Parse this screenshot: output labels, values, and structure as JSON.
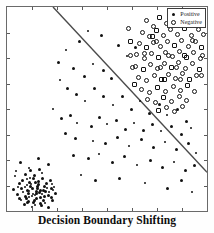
{
  "caption": "Decision Boundary Shifting",
  "legend": {
    "position": "top-right",
    "entries": [
      {
        "label": "Positive",
        "marker": "filled-dot",
        "color": "#111111"
      },
      {
        "label": "Negative",
        "marker": "open-circle",
        "color": "#111111"
      }
    ]
  },
  "chart_data": {
    "type": "scatter",
    "title": "Decision Boundary Shifting",
    "xlabel": "",
    "ylabel": "",
    "xlim": [
      0,
      1
    ],
    "ylim": [
      0,
      1
    ],
    "grid": false,
    "axis_ticks": {
      "x_count": 8,
      "y_count": 8,
      "labels_shown": false
    },
    "frame": true,
    "annotations": [
      {
        "name": "decision-boundary",
        "type": "line",
        "from": [
          0.23,
          1.0
        ],
        "to": [
          1.0,
          0.19
        ],
        "color": "#4a4a4a",
        "width": 1.4
      }
    ],
    "series": [
      {
        "name": "Positive",
        "marker": "filled-dot",
        "color": "#111111",
        "points": [
          [
            0.065,
            0.238
          ],
          [
            0.11,
            0.21
          ],
          [
            0.155,
            0.255
          ],
          [
            0.205,
            0.228
          ],
          [
            0.04,
            0.17
          ],
          [
            0.09,
            0.18
          ],
          [
            0.13,
            0.16
          ],
          [
            0.175,
            0.185
          ],
          [
            0.215,
            0.15
          ],
          [
            0.06,
            0.135
          ],
          [
            0.1,
            0.128
          ],
          [
            0.14,
            0.14
          ],
          [
            0.185,
            0.12
          ],
          [
            0.225,
            0.132
          ],
          [
            0.03,
            0.105
          ],
          [
            0.072,
            0.112
          ],
          [
            0.112,
            0.1
          ],
          [
            0.15,
            0.108
          ],
          [
            0.192,
            0.095
          ],
          [
            0.232,
            0.102
          ],
          [
            0.05,
            0.08
          ],
          [
            0.09,
            0.072
          ],
          [
            0.128,
            0.085
          ],
          [
            0.168,
            0.065
          ],
          [
            0.208,
            0.078
          ],
          [
            0.068,
            0.055
          ],
          [
            0.108,
            0.048
          ],
          [
            0.148,
            0.06
          ],
          [
            0.188,
            0.04
          ],
          [
            0.228,
            0.052
          ],
          [
            0.085,
            0.03
          ],
          [
            0.125,
            0.022
          ],
          [
            0.165,
            0.035
          ],
          [
            0.205,
            0.018
          ],
          [
            0.045,
            0.195
          ],
          [
            0.118,
            0.198
          ],
          [
            0.16,
            0.205
          ],
          [
            0.098,
            0.155
          ],
          [
            0.138,
            0.172
          ],
          [
            0.178,
            0.158
          ],
          [
            0.078,
            0.092
          ],
          [
            0.118,
            0.118
          ],
          [
            0.158,
            0.128
          ],
          [
            0.198,
            0.112
          ],
          [
            0.105,
            0.088
          ],
          [
            0.145,
            0.095
          ],
          [
            0.125,
            0.075
          ],
          [
            0.095,
            0.062
          ],
          [
            0.135,
            0.05
          ],
          [
            0.175,
            0.082
          ],
          [
            0.112,
            0.142
          ],
          [
            0.152,
            0.118
          ],
          [
            0.088,
            0.12
          ],
          [
            0.128,
            0.11
          ],
          [
            0.168,
            0.1
          ],
          [
            0.108,
            0.068
          ],
          [
            0.148,
            0.088
          ],
          [
            0.188,
            0.07
          ],
          [
            0.12,
            0.132
          ],
          [
            0.16,
            0.09
          ],
          [
            0.1,
            0.1
          ],
          [
            0.14,
            0.078
          ],
          [
            0.18,
            0.05
          ],
          [
            0.22,
            0.065
          ],
          [
            0.055,
            0.118
          ],
          [
            0.13,
            0.04
          ],
          [
            0.17,
            0.028
          ],
          [
            0.21,
            0.095
          ],
          [
            0.24,
            0.085
          ],
          [
            0.075,
            0.148
          ],
          [
            0.115,
            0.162
          ],
          [
            0.155,
            0.145
          ],
          [
            0.195,
            0.135
          ],
          [
            0.235,
            0.118
          ],
          [
            0.062,
            0.062
          ],
          [
            0.102,
            0.04
          ],
          [
            0.142,
            0.03
          ],
          [
            0.182,
            0.102
          ],
          [
            0.222,
            0.112
          ],
          [
            0.295,
            0.79
          ],
          [
            0.33,
            0.7
          ],
          [
            0.36,
            0.83
          ],
          [
            0.405,
            0.88
          ],
          [
            0.47,
            0.86
          ],
          [
            0.555,
            0.81
          ],
          [
            0.6,
            0.76
          ],
          [
            0.64,
            0.8
          ],
          [
            0.255,
            0.73
          ],
          [
            0.265,
            0.64
          ],
          [
            0.3,
            0.6
          ],
          [
            0.345,
            0.57
          ],
          [
            0.39,
            0.54
          ],
          [
            0.435,
            0.6
          ],
          [
            0.48,
            0.56
          ],
          [
            0.53,
            0.52
          ],
          [
            0.575,
            0.56
          ],
          [
            0.62,
            0.5
          ],
          [
            0.665,
            0.54
          ],
          [
            0.71,
            0.48
          ],
          [
            0.76,
            0.52
          ],
          [
            0.8,
            0.47
          ],
          [
            0.85,
            0.5
          ],
          [
            0.895,
            0.44
          ],
          [
            0.23,
            0.5
          ],
          [
            0.27,
            0.455
          ],
          [
            0.315,
            0.47
          ],
          [
            0.35,
            0.43
          ],
          [
            0.42,
            0.415
          ],
          [
            0.46,
            0.46
          ],
          [
            0.5,
            0.425
          ],
          [
            0.545,
            0.445
          ],
          [
            0.59,
            0.4
          ],
          [
            0.635,
            0.43
          ],
          [
            0.68,
            0.395
          ],
          [
            0.725,
            0.425
          ],
          [
            0.77,
            0.39
          ],
          [
            0.82,
            0.415
          ],
          [
            0.87,
            0.375
          ],
          [
            0.92,
            0.405
          ],
          [
            0.29,
            0.38
          ],
          [
            0.34,
            0.355
          ],
          [
            0.43,
            0.345
          ],
          [
            0.49,
            0.33
          ],
          [
            0.55,
            0.36
          ],
          [
            0.61,
            0.32
          ],
          [
            0.67,
            0.35
          ],
          [
            0.73,
            0.31
          ],
          [
            0.79,
            0.34
          ],
          [
            0.845,
            0.3
          ],
          [
            0.905,
            0.33
          ],
          [
            0.945,
            0.285
          ],
          [
            0.33,
            0.27
          ],
          [
            0.405,
            0.255
          ],
          [
            0.46,
            0.28
          ],
          [
            0.525,
            0.24
          ],
          [
            0.585,
            0.265
          ],
          [
            0.65,
            0.225
          ],
          [
            0.715,
            0.25
          ],
          [
            0.775,
            0.215
          ],
          [
            0.835,
            0.24
          ],
          [
            0.89,
            0.2
          ],
          [
            0.935,
            0.225
          ],
          [
            0.37,
            0.175
          ],
          [
            0.44,
            0.15
          ],
          [
            0.56,
            0.16
          ],
          [
            0.69,
            0.135
          ],
          [
            0.8,
            0.11
          ],
          [
            0.87,
            0.15
          ],
          [
            0.925,
            0.095
          ],
          [
            0.48,
            0.69
          ],
          [
            0.52,
            0.65
          ],
          [
            0.43,
            0.72
          ],
          [
            0.385,
            0.66
          ]
        ]
      },
      {
        "name": "Negative",
        "marker": "open-circle",
        "color": "#141414",
        "points": [
          [
            0.7,
            0.93
          ],
          [
            0.735,
            0.9
          ],
          [
            0.765,
            0.945
          ],
          [
            0.8,
            0.915
          ],
          [
            0.835,
            0.95
          ],
          [
            0.87,
            0.92
          ],
          [
            0.905,
            0.945
          ],
          [
            0.94,
            0.91
          ],
          [
            0.68,
            0.875
          ],
          [
            0.715,
            0.855
          ],
          [
            0.75,
            0.88
          ],
          [
            0.785,
            0.86
          ],
          [
            0.82,
            0.885
          ],
          [
            0.855,
            0.865
          ],
          [
            0.89,
            0.89
          ],
          [
            0.925,
            0.86
          ],
          [
            0.96,
            0.885
          ],
          [
            0.665,
            0.82
          ],
          [
            0.7,
            0.8
          ],
          [
            0.735,
            0.825
          ],
          [
            0.77,
            0.805
          ],
          [
            0.805,
            0.83
          ],
          [
            0.84,
            0.81
          ],
          [
            0.875,
            0.835
          ],
          [
            0.91,
            0.805
          ],
          [
            0.945,
            0.83
          ],
          [
            0.975,
            0.8
          ],
          [
            0.65,
            0.765
          ],
          [
            0.69,
            0.745
          ],
          [
            0.725,
            0.77
          ],
          [
            0.76,
            0.75
          ],
          [
            0.795,
            0.775
          ],
          [
            0.83,
            0.755
          ],
          [
            0.865,
            0.78
          ],
          [
            0.9,
            0.75
          ],
          [
            0.935,
            0.775
          ],
          [
            0.97,
            0.745
          ],
          [
            0.645,
            0.705
          ],
          [
            0.685,
            0.69
          ],
          [
            0.72,
            0.715
          ],
          [
            0.755,
            0.695
          ],
          [
            0.79,
            0.72
          ],
          [
            0.825,
            0.7
          ],
          [
            0.86,
            0.725
          ],
          [
            0.895,
            0.695
          ],
          [
            0.93,
            0.72
          ],
          [
            0.965,
            0.69
          ],
          [
            0.66,
            0.65
          ],
          [
            0.7,
            0.635
          ],
          [
            0.74,
            0.66
          ],
          [
            0.775,
            0.64
          ],
          [
            0.81,
            0.665
          ],
          [
            0.845,
            0.645
          ],
          [
            0.88,
            0.67
          ],
          [
            0.915,
            0.64
          ],
          [
            0.95,
            0.66
          ],
          [
            0.675,
            0.595
          ],
          [
            0.715,
            0.58
          ],
          [
            0.755,
            0.605
          ],
          [
            0.795,
            0.585
          ],
          [
            0.835,
            0.61
          ],
          [
            0.87,
            0.59
          ],
          [
            0.905,
            0.615
          ],
          [
            0.94,
            0.585
          ],
          [
            0.705,
            0.545
          ],
          [
            0.745,
            0.53
          ],
          [
            0.785,
            0.555
          ],
          [
            0.825,
            0.535
          ],
          [
            0.865,
            0.56
          ],
          [
            0.9,
            0.54
          ],
          [
            0.76,
            0.49
          ],
          [
            0.8,
            0.505
          ],
          [
            0.84,
            0.485
          ],
          [
            0.88,
            0.51
          ],
          [
            0.73,
            0.855
          ],
          [
            0.77,
            0.7
          ],
          [
            0.81,
            0.76
          ],
          [
            0.85,
            0.7
          ],
          [
            0.89,
            0.76
          ],
          [
            0.93,
            0.835
          ],
          [
            0.69,
            0.77
          ],
          [
            0.75,
            0.83
          ],
          [
            0.79,
            0.64
          ],
          [
            0.87,
            0.64
          ],
          [
            0.62,
            0.76
          ],
          [
            0.63,
            0.7
          ],
          [
            0.64,
            0.62
          ],
          [
            0.985,
            0.865
          ],
          [
            0.98,
            0.76
          ],
          [
            0.975,
            0.66
          ],
          [
            0.62,
            0.83
          ],
          [
            0.61,
            0.89
          ]
        ]
      }
    ]
  }
}
